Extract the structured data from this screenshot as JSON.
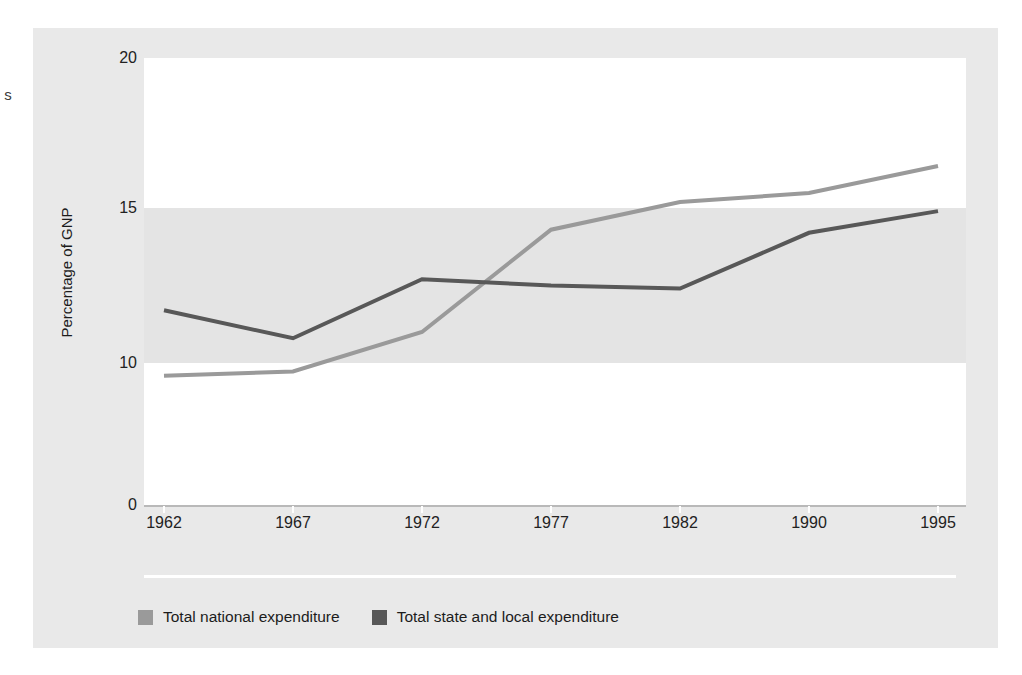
{
  "page": {
    "margin_glyphs": "s"
  },
  "chart_data": {
    "type": "line",
    "title": "",
    "subtitle": "",
    "xlabel": "",
    "ylabel": "Percentage of GNP",
    "categories": [
      "1962",
      "1967",
      "1972",
      "1977",
      "1982",
      "1990",
      "1995"
    ],
    "x_tick_labels": [
      "1962",
      "1967",
      "1972",
      "1977",
      "1982",
      "1990",
      "1995"
    ],
    "y_tick_labels": [
      "20",
      "15",
      "10",
      "0"
    ],
    "y_tick_values": [
      20,
      15,
      10,
      0
    ],
    "y_axis_note": "broken / non-linear axis: the 0-to-10 segment is compressed",
    "ylim": [
      0,
      20
    ],
    "grid": false,
    "banded_background": true,
    "legend_position": "bottom-left",
    "series": [
      {
        "name": "Total national expenditure",
        "color": "#9a9a9a",
        "values": [
          9.1,
          9.4,
          11.0,
          14.3,
          15.2,
          15.5,
          16.4
        ]
      },
      {
        "name": "Total state and local expenditure",
        "color": "#585858",
        "values": [
          11.7,
          10.8,
          12.7,
          12.5,
          12.4,
          14.2,
          14.9
        ]
      }
    ]
  },
  "legend": {
    "items": [
      {
        "label": "Total national expenditure",
        "color": "#9a9a9a"
      },
      {
        "label": "Total state and local expenditure",
        "color": "#585858"
      }
    ]
  },
  "colors": {
    "panel_background": "#e9e9e9",
    "band_white": "#ffffff",
    "band_gray": "#e4e4e4",
    "series_national": "#9a9a9a",
    "series_state_local": "#585858",
    "axis": "#b9b9b9",
    "text": "#1c1c1c"
  }
}
